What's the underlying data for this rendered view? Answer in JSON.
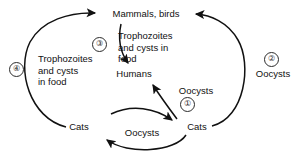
{
  "diagram": {
    "line_color": "#111111",
    "marker_color": "#2b2b2b",
    "background": "#ffffff",
    "nodes": [
      {
        "id": "mammals_birds",
        "label": "Mammals, birds"
      },
      {
        "id": "humans",
        "label": "Humans"
      },
      {
        "id": "cats_left",
        "label": "Cats"
      },
      {
        "id": "cats_right",
        "label": "Cats"
      }
    ],
    "edge_labels": [
      {
        "id": "food_left",
        "label": "Trophozoites\nand cysts\nin food"
      },
      {
        "id": "food_center",
        "label": "Trophozoites\nand cysts in\nfood"
      },
      {
        "id": "oocysts_right",
        "label": "Oocysts"
      },
      {
        "id": "oocysts_center",
        "label": "Oocysts"
      },
      {
        "id": "oocysts_bottom",
        "label": "Oocysts"
      }
    ],
    "route_markers": [
      {
        "id": "route-1",
        "label": "①"
      },
      {
        "id": "route-2",
        "label": "②"
      },
      {
        "id": "route-3",
        "label": "③"
      },
      {
        "id": "route-4",
        "label": "④"
      }
    ]
  }
}
